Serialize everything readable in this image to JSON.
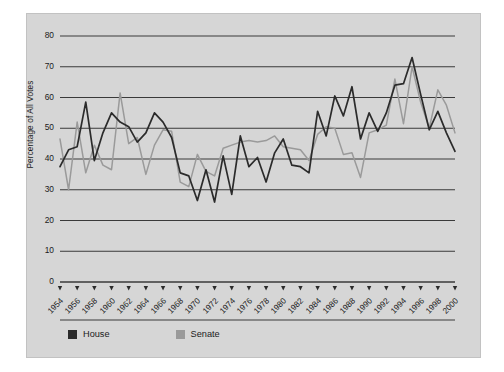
{
  "chart_data": {
    "type": "line",
    "title": "",
    "xlabel": "",
    "ylabel": "Percentage of All Votes",
    "ylim": [
      0,
      80
    ],
    "yticks": [
      0,
      10,
      20,
      30,
      40,
      50,
      60,
      70,
      80
    ],
    "xlim": [
      1954,
      2000
    ],
    "xticks": [
      1954,
      1956,
      1958,
      1960,
      1962,
      1964,
      1966,
      1968,
      1970,
      1972,
      1974,
      1976,
      1978,
      1980,
      1982,
      1984,
      1986,
      1988,
      1990,
      1992,
      1994,
      1996,
      1998,
      2000
    ],
    "xtick_labels": [
      "1954",
      "1956",
      "1958",
      "1960",
      "1962",
      "1964",
      "1966",
      "1968",
      "1970",
      "1972",
      "1974",
      "1976",
      "1978",
      "1980",
      "1982",
      "1984",
      "1986",
      "1988",
      "1990",
      "1992",
      "1994",
      "1996",
      "1998",
      "2000"
    ],
    "grid": "horizontal",
    "legend_position": "bottom-left",
    "x": [
      1954,
      1955,
      1956,
      1957,
      1958,
      1959,
      1960,
      1961,
      1962,
      1963,
      1964,
      1965,
      1966,
      1967,
      1968,
      1969,
      1970,
      1971,
      1972,
      1973,
      1974,
      1975,
      1976,
      1977,
      1978,
      1979,
      1980,
      1981,
      1982,
      1983,
      1984,
      1985,
      1986,
      1987,
      1988,
      1989,
      1990,
      1991,
      1992,
      1993,
      1994,
      1995,
      1996,
      1997,
      1998,
      1999,
      2000
    ],
    "series": [
      {
        "name": "House",
        "color": "#2b2b2b",
        "values": [
          37.5,
          43.0,
          44.0,
          58.5,
          39.5,
          48.5,
          55.0,
          52.0,
          50.5,
          45.5,
          48.5,
          55.0,
          52.0,
          47.0,
          35.5,
          34.5,
          26.5,
          36.5,
          26.0,
          41.0,
          28.5,
          47.5,
          37.5,
          40.5,
          32.5,
          42.0,
          46.5,
          38.0,
          37.5,
          35.5,
          55.5,
          47.5,
          60.5,
          54.0,
          63.5,
          46.5,
          55.0,
          49.0,
          55.0,
          64.0,
          64.5,
          73.0,
          61.0,
          49.5,
          55.5,
          48.5,
          42.5
        ]
      },
      {
        "name": "Senate",
        "color": "#9a9a9a",
        "values": [
          46.5,
          30.0,
          52.0,
          35.5,
          44.5,
          38.0,
          36.5,
          61.5,
          45.0,
          47.0,
          35.0,
          44.5,
          49.5,
          49.0,
          32.5,
          31.0,
          41.5,
          36.0,
          34.5,
          43.5,
          44.5,
          45.5,
          46.0,
          45.5,
          46.0,
          47.5,
          44.0,
          43.5,
          43.0,
          39.5,
          48.0,
          50.5,
          50.0,
          41.5,
          42.0,
          34.0,
          48.5,
          49.5,
          51.0,
          66.0,
          51.5,
          70.0,
          58.5,
          50.0,
          62.5,
          57.5,
          48.5
        ]
      }
    ]
  },
  "legend": {
    "items": [
      {
        "label": "House",
        "color": "#2b2b2b"
      },
      {
        "label": "Senate",
        "color": "#9a9a9a"
      }
    ]
  },
  "axis": {
    "y_title": "Percentage of All Votes"
  }
}
